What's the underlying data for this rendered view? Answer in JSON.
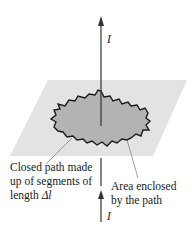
{
  "figure": {
    "current_label_top": "I",
    "current_label_bottom": "I",
    "path_label": {
      "lines": [
        "Closed path made",
        "up of segments of",
        "length "
      ],
      "delta_symbol": "Δl"
    },
    "area_label": {
      "lines": [
        "Area enclosed",
        "by the path"
      ]
    },
    "colors": {
      "plane": "#e3e3e3",
      "area": "#b3b3b3",
      "path": "#1a1a1a",
      "wire": "#333333",
      "leader": "#777777"
    }
  }
}
